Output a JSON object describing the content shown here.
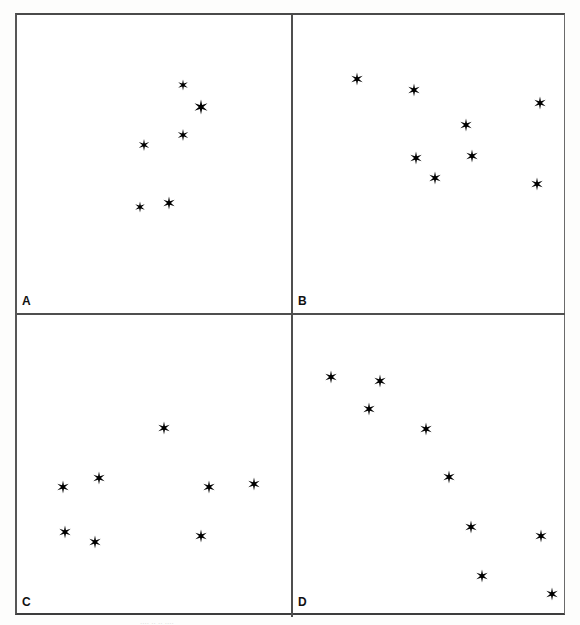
{
  "figure": {
    "background_color": "#ffffff",
    "frame_color": "#4f4f4f",
    "star_color": "#000000",
    "star_glyph": "six-pointed-star"
  },
  "panels": [
    {
      "id": "a",
      "label": "A",
      "star_count": 6
    },
    {
      "id": "b",
      "label": "B",
      "star_count": 8
    },
    {
      "id": "c",
      "label": "C",
      "star_count": 8
    },
    {
      "id": "d",
      "label": "D",
      "star_count": 9
    }
  ],
  "caption": {
    "remnant_text": "....  ..   ..  ...."
  },
  "chart_data": {
    "type": "scatter",
    "xlabel": "",
    "ylabel": "",
    "grid": false,
    "legend": null,
    "note": "Four panels (A, B, C, D) each showing a scatter of star glyphs. Coordinates are given in panel-local pixels with origin at the panel's top-left corner; x increases right, y increases down. Panel sizes: A 274x298, B 272x298, C 274x300, D 272x300.",
    "panels": [
      {
        "label": "A",
        "xlim": [
          0,
          274
        ],
        "ylim": [
          298,
          0
        ],
        "points": [
          {
            "x": 166,
            "y": 70,
            "size": 11
          },
          {
            "x": 184,
            "y": 92,
            "size": 15
          },
          {
            "x": 166,
            "y": 120,
            "size": 12
          },
          {
            "x": 127,
            "y": 130,
            "size": 12
          },
          {
            "x": 123,
            "y": 192,
            "size": 11
          },
          {
            "x": 152,
            "y": 188,
            "size": 13
          }
        ]
      },
      {
        "label": "B",
        "xlim": [
          0,
          272
        ],
        "ylim": [
          298,
          0
        ],
        "points": [
          {
            "x": 64,
            "y": 64,
            "size": 13
          },
          {
            "x": 121,
            "y": 75,
            "size": 13
          },
          {
            "x": 247,
            "y": 88,
            "size": 13
          },
          {
            "x": 173,
            "y": 110,
            "size": 13
          },
          {
            "x": 123,
            "y": 143,
            "size": 13
          },
          {
            "x": 179,
            "y": 141,
            "size": 13
          },
          {
            "x": 142,
            "y": 163,
            "size": 13
          },
          {
            "x": 244,
            "y": 169,
            "size": 13
          }
        ]
      },
      {
        "label": "C",
        "xlim": [
          0,
          274
        ],
        "ylim": [
          300,
          0
        ],
        "points": [
          {
            "x": 147,
            "y": 113,
            "size": 13
          },
          {
            "x": 82,
            "y": 163,
            "size": 13
          },
          {
            "x": 46,
            "y": 172,
            "size": 13
          },
          {
            "x": 192,
            "y": 172,
            "size": 13
          },
          {
            "x": 237,
            "y": 169,
            "size": 13
          },
          {
            "x": 48,
            "y": 217,
            "size": 13
          },
          {
            "x": 184,
            "y": 221,
            "size": 13
          },
          {
            "x": 78,
            "y": 227,
            "size": 13
          }
        ]
      },
      {
        "label": "D",
        "xlim": [
          0,
          272
        ],
        "ylim": [
          300,
          0
        ],
        "points": [
          {
            "x": 38,
            "y": 62,
            "size": 13
          },
          {
            "x": 87,
            "y": 66,
            "size": 13
          },
          {
            "x": 76,
            "y": 94,
            "size": 13
          },
          {
            "x": 133,
            "y": 114,
            "size": 13
          },
          {
            "x": 156,
            "y": 162,
            "size": 13
          },
          {
            "x": 178,
            "y": 212,
            "size": 13
          },
          {
            "x": 248,
            "y": 221,
            "size": 13
          },
          {
            "x": 189,
            "y": 261,
            "size": 13
          },
          {
            "x": 259,
            "y": 279,
            "size": 13
          }
        ]
      }
    ]
  }
}
